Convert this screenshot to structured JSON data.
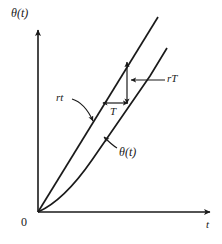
{
  "figure": {
    "type": "line-diagram",
    "background_color": "#ffffff",
    "stroke_color": "#1a1a1a",
    "axes": {
      "y_axis_label": "θ(t)",
      "x_axis_label": "t",
      "origin_label": "0",
      "y_axis": {
        "x": 38,
        "y_top": 28,
        "y_bottom": 212,
        "arrow": "up"
      },
      "x_axis": {
        "y": 212,
        "x_left": 38,
        "x_right": 212,
        "arrow": "right"
      }
    },
    "curves": [
      {
        "name": "ramp-line",
        "label": "rt",
        "description": "straight line through origin with slope r",
        "points": [
          [
            38,
            212
          ],
          [
            158,
            17
          ]
        ]
      },
      {
        "name": "theta-curve",
        "label": "θ(t)",
        "description": "delayed lagging response curve approaching the ramp asymptotically",
        "points": [
          [
            38,
            212
          ],
          [
            52,
            203
          ],
          [
            68,
            190
          ],
          [
            84,
            172
          ],
          [
            100,
            152
          ],
          [
            118,
            128
          ],
          [
            136,
            102
          ],
          [
            152,
            76
          ],
          [
            167,
            48
          ]
        ]
      }
    ],
    "annotations": [
      {
        "name": "vertical-measure",
        "label": "rT",
        "kind": "double-arrow-vertical",
        "x": 127,
        "y_top": 62,
        "y_bottom": 103,
        "leader": {
          "from_x": 130,
          "to_x": 165,
          "y": 80,
          "arrow": "left"
        },
        "label_position": {
          "x": 167,
          "y": 73
        }
      },
      {
        "name": "horizontal-measure",
        "label": "T",
        "kind": "double-arrow-horizontal",
        "y": 103,
        "x_left": 103,
        "x_right": 128,
        "label_position": {
          "x": 110,
          "y": 106
        }
      },
      {
        "name": "ramp-callout",
        "label": "rt",
        "kind": "curved-leader",
        "label_position": {
          "x": 56,
          "y": 92
        },
        "target": {
          "x": 93,
          "y": 121
        }
      },
      {
        "name": "theta-callout",
        "label": "θ(t)",
        "kind": "straight-leader",
        "label_position": {
          "x": 119,
          "y": 146
        },
        "target": {
          "x": 104,
          "y": 137
        }
      }
    ]
  }
}
